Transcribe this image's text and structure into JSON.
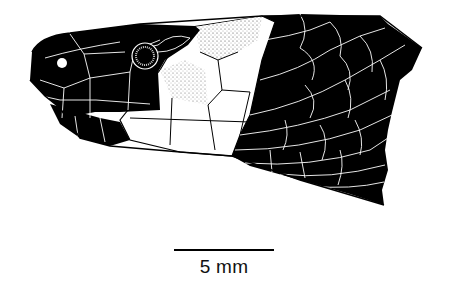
{
  "figure": {
    "colors": {
      "head_dark": "#000000",
      "collar_light": "#ffffff",
      "stipple": "#888888",
      "scale_lines": "#ffffff",
      "outline": "#000000"
    }
  },
  "scale_bar": {
    "label": "5 mm"
  }
}
